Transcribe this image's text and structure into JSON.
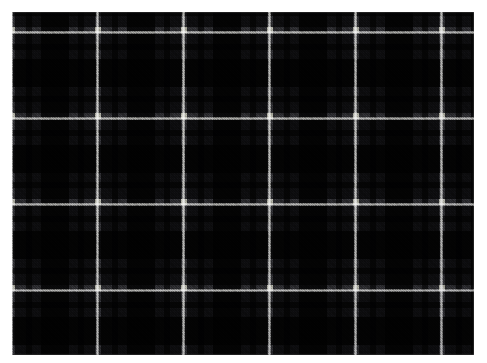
{
  "image": {
    "subject": "tartan-plaid-fabric-swatch",
    "description": "Photograph of a dark tartan plaid woven fabric on a white background",
    "canvas": {
      "width": 487,
      "height": 363,
      "background": "#ffffff"
    },
    "swatch": {
      "x": 12,
      "y": 12,
      "width": 462,
      "height": 343
    }
  },
  "fabric": {
    "weave": "twill",
    "twill_direction": "right-hand-diagonal",
    "sett_repeat_px": 86,
    "warp_offset_px": 0,
    "weft_offset_px": 18,
    "palette": {
      "ground": "#232327",
      "mid_grey": "#3a3a40",
      "dark": "#141417",
      "near_black": "#0a0a0c",
      "navy": "#1a1d26",
      "overcheck_white": "#d8d8d2",
      "overcheck_soft": "#9a9a96",
      "background": "#ffffff"
    },
    "sett_sequence": [
      {
        "color": "#d8d8d2",
        "name": "white-overcheck",
        "width_px": 3
      },
      {
        "color": "#3a3a40",
        "name": "mid-grey",
        "width_px": 11
      },
      {
        "color": "#141417",
        "name": "dark-stripe",
        "width_px": 6
      },
      {
        "color": "#3a3a40",
        "name": "mid-grey",
        "width_px": 9
      },
      {
        "color": "#0a0a0c",
        "name": "black-block",
        "width_px": 28
      },
      {
        "color": "#3a3a40",
        "name": "mid-grey",
        "width_px": 9
      },
      {
        "color": "#141417",
        "name": "dark-stripe",
        "width_px": 6
      },
      {
        "color": "#3a3a40",
        "name": "mid-grey",
        "width_px": 11
      },
      {
        "color": "#d8d8d2",
        "name": "white-overcheck",
        "width_px": 3
      }
    ],
    "overcheck_lines": {
      "vertical_x_px": [
        1,
        87,
        172,
        257,
        343,
        428
      ],
      "horizontal_y_px": [
        18,
        104,
        190,
        276,
        337
      ]
    }
  }
}
